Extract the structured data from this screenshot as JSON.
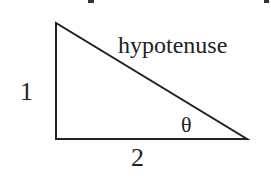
{
  "diagram": {
    "type": "right-triangle",
    "vertices": {
      "top": [
        56,
        23
      ],
      "right_angle": [
        56,
        139
      ],
      "acute": [
        247,
        139
      ]
    },
    "labels": {
      "hypotenuse": "hypotenuse",
      "vertical_side": "1",
      "horizontal_side": "2",
      "angle": "θ"
    },
    "stroke_color": "#222222",
    "background": "#ffffff"
  }
}
